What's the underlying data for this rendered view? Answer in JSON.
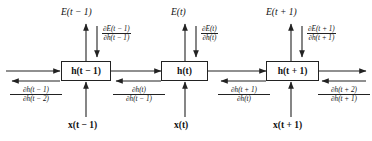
{
  "figure": {
    "background_color": "#ffffff",
    "line_color": "#222222",
    "text_color": "#111111"
  },
  "cells": [
    {
      "id": "cell-prev",
      "state_label": "h(t − 1)",
      "input_label": "x(t − 1)",
      "output_label": "E(t − 1)"
    },
    {
      "id": "cell-curr",
      "state_label": "h(t)",
      "input_label": "x(t)",
      "output_label": "E(t)"
    },
    {
      "id": "cell-next",
      "state_label": "h(t + 1)",
      "input_label": "x(t + 1)",
      "output_label": "E(t + 1)"
    }
  ],
  "output_gradients": [
    {
      "numerator": "∂E(t − 1)",
      "denominator": "∂h(t − 1)"
    },
    {
      "numerator": "∂E(t)",
      "denominator": "∂h(t)"
    },
    {
      "numerator": "∂E(t + 1)",
      "denominator": "∂h(t + 1)"
    }
  ],
  "state_gradients": [
    {
      "numerator": "∂h(t − 1)",
      "denominator": "∂h(t − 2)"
    },
    {
      "numerator": "∂h(t)",
      "denominator": "∂h(t − 1)"
    },
    {
      "numerator": "∂h(t + 1)",
      "denominator": "∂h(t)"
    },
    {
      "numerator": "∂h(t + 2)",
      "denominator": "∂h(t + 1)"
    }
  ]
}
